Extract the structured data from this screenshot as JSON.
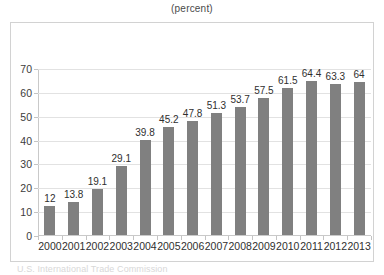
{
  "chart_data": {
    "type": "bar",
    "title": "(percent)",
    "xlabel": "",
    "ylabel": "",
    "categories": [
      "2000",
      "2001",
      "2002",
      "2003",
      "2004",
      "2005",
      "2006",
      "2007",
      "2008",
      "2009",
      "2010",
      "2011",
      "2012",
      "2013"
    ],
    "values": [
      12,
      13.8,
      19.1,
      29.1,
      39.8,
      45.2,
      47.8,
      51.3,
      53.7,
      57.5,
      61.5,
      64.4,
      63.3,
      64
    ],
    "value_labels": [
      "12",
      "13.8",
      "19.1",
      "29.1",
      "39.8",
      "45.2",
      "47.8",
      "51.3",
      "53.7",
      "57.5",
      "61.5",
      "64.4",
      "63.3",
      "64"
    ],
    "ylim": [
      0,
      70
    ],
    "ytick_values": [
      0,
      10,
      20,
      30,
      40,
      50,
      60,
      70
    ],
    "ytick_labels": [
      "0",
      "10",
      "20",
      "30",
      "40",
      "50",
      "60",
      "70"
    ],
    "grid": true,
    "legend": "none",
    "series": [
      {
        "name": "percent",
        "color": "#808080",
        "values": [
          12,
          13.8,
          19.1,
          29.1,
          39.8,
          45.2,
          47.8,
          51.3,
          53.7,
          57.5,
          61.5,
          64.4,
          63.3,
          64
        ]
      }
    ]
  },
  "colors": {
    "bar": "#808080",
    "gridline": "#e2e2e2",
    "axis": "#c9c9c9",
    "frame": "#d2d2d2",
    "text": "#2f2f2f",
    "background": "#ffffff"
  },
  "footer": {
    "source_note": "U.S. International Trade Commission"
  }
}
